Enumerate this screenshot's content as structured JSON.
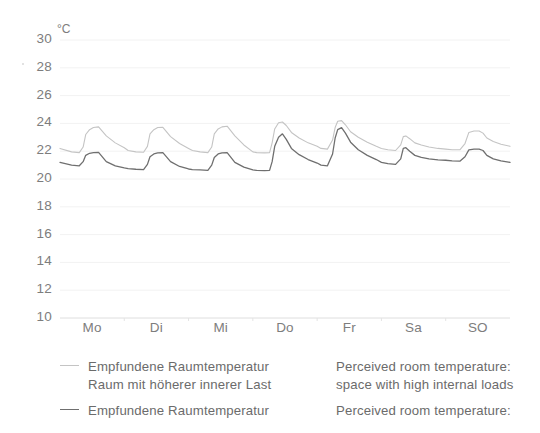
{
  "chart_data": {
    "type": "line",
    "title": "",
    "xlabel": "",
    "ylabel": "",
    "unit_label": "°C",
    "ylim": [
      10,
      30
    ],
    "ytick_step": 2,
    "yticks": [
      30,
      28,
      26,
      24,
      22,
      20,
      18,
      16,
      14,
      12,
      10
    ],
    "grid": true,
    "grid_axis": "y",
    "legend_position": "below",
    "categories": [
      "Mo",
      "Di",
      "Mi",
      "Do",
      "Fr",
      "Sa",
      "SO"
    ],
    "x_unit": "day of week",
    "series": [
      {
        "name": "Empfundene Raumtemperatur Raum mit höherer innerer Last",
        "name_en": "Perceived room temperature: space with high internal loads",
        "color": "#c4c4c4",
        "x": [
          0.0,
          0.18,
          0.3,
          0.36,
          0.4,
          0.46,
          0.52,
          0.6,
          0.72,
          0.86,
          1.0,
          1.06,
          1.18,
          1.3,
          1.36,
          1.4,
          1.46,
          1.52,
          1.6,
          1.72,
          1.86,
          2.0,
          2.06,
          2.18,
          2.3,
          2.36,
          2.4,
          2.46,
          2.52,
          2.6,
          2.72,
          2.86,
          3.0,
          3.06,
          3.18,
          3.26,
          3.3,
          3.34,
          3.4,
          3.46,
          3.52,
          3.6,
          3.72,
          3.86,
          4.0,
          4.06,
          4.16,
          4.24,
          4.28,
          4.32,
          4.38,
          4.44,
          4.52,
          4.64,
          4.78,
          4.92,
          5.0,
          5.1,
          5.22,
          5.3,
          5.34,
          5.38,
          5.44,
          5.52,
          5.62,
          5.74,
          5.88,
          6.0,
          6.1,
          6.22,
          6.3,
          6.36,
          6.44,
          6.52,
          6.58,
          6.64,
          6.74,
          6.86,
          7.0
        ],
        "values": [
          22.2,
          21.95,
          21.9,
          22.3,
          23.2,
          23.55,
          23.7,
          23.75,
          23.1,
          22.6,
          22.25,
          22.05,
          21.95,
          21.92,
          22.35,
          23.25,
          23.55,
          23.7,
          23.72,
          23.05,
          22.55,
          22.2,
          22.05,
          21.95,
          21.9,
          22.3,
          23.25,
          23.6,
          23.75,
          23.8,
          23.1,
          22.45,
          21.95,
          21.9,
          21.88,
          21.9,
          22.6,
          23.6,
          24.05,
          24.1,
          23.85,
          23.35,
          22.95,
          22.6,
          22.35,
          22.2,
          22.15,
          22.8,
          23.7,
          24.15,
          24.2,
          23.9,
          23.4,
          23.0,
          22.65,
          22.35,
          22.2,
          22.1,
          22.05,
          22.45,
          23.05,
          23.1,
          22.9,
          22.6,
          22.45,
          22.3,
          22.2,
          22.15,
          22.1,
          22.1,
          22.55,
          23.35,
          23.45,
          23.45,
          23.3,
          22.95,
          22.7,
          22.5,
          22.35
        ]
      },
      {
        "name": "Empfundene Raumtemperatur",
        "name_en": "Perceived room temperature:",
        "color": "#6f6f6f",
        "x": [
          0.0,
          0.18,
          0.3,
          0.36,
          0.4,
          0.46,
          0.52,
          0.6,
          0.72,
          0.86,
          1.0,
          1.06,
          1.18,
          1.3,
          1.36,
          1.4,
          1.46,
          1.52,
          1.6,
          1.72,
          1.86,
          2.0,
          2.06,
          2.18,
          2.3,
          2.36,
          2.4,
          2.46,
          2.52,
          2.6,
          2.72,
          2.86,
          3.0,
          3.06,
          3.18,
          3.26,
          3.3,
          3.34,
          3.4,
          3.46,
          3.52,
          3.6,
          3.72,
          3.86,
          4.0,
          4.06,
          4.16,
          4.24,
          4.28,
          4.32,
          4.38,
          4.44,
          4.52,
          4.64,
          4.78,
          4.92,
          5.0,
          5.1,
          5.22,
          5.3,
          5.34,
          5.38,
          5.44,
          5.52,
          5.62,
          5.74,
          5.88,
          6.0,
          6.1,
          6.22,
          6.3,
          6.36,
          6.44,
          6.52,
          6.58,
          6.64,
          6.74,
          6.86,
          7.0
        ],
        "values": [
          21.2,
          21.0,
          20.95,
          21.25,
          21.7,
          21.85,
          21.9,
          21.92,
          21.25,
          20.95,
          20.8,
          20.75,
          20.7,
          20.68,
          21.05,
          21.6,
          21.8,
          21.88,
          21.9,
          21.25,
          20.9,
          20.72,
          20.68,
          20.65,
          20.62,
          21.0,
          21.55,
          21.8,
          21.88,
          21.9,
          21.2,
          20.85,
          20.65,
          20.62,
          20.6,
          20.62,
          21.25,
          22.35,
          23.0,
          23.25,
          22.85,
          22.2,
          21.75,
          21.4,
          21.15,
          21.0,
          20.95,
          21.8,
          22.95,
          23.55,
          23.7,
          23.3,
          22.65,
          22.1,
          21.7,
          21.4,
          21.2,
          21.1,
          21.05,
          21.45,
          22.2,
          22.25,
          22.0,
          21.7,
          21.55,
          21.45,
          21.38,
          21.35,
          21.3,
          21.28,
          21.6,
          22.1,
          22.15,
          22.15,
          22.05,
          21.7,
          21.45,
          21.3,
          21.2
        ]
      }
    ]
  },
  "legend": {
    "entries": [
      {
        "swatch": "light-line-swatch",
        "de_line1": "Empfundene Raumtemperatur",
        "de_line2": "Raum mit höherer innerer Last",
        "en_line1": "Perceived room temperature:",
        "en_line2": "space with high internal loads"
      },
      {
        "swatch": "dark-line-swatch",
        "de_line1": "Empfundene Raumtemperatur",
        "de_line2": "",
        "en_line1": "Perceived room temperature:",
        "en_line2": ""
      }
    ]
  },
  "colors": {
    "series_light": "#c4c4c4",
    "series_dark": "#6f6f6f",
    "grid": "#f2f2f2",
    "axis": "#e4e4e4",
    "text": "#7d7d7d"
  }
}
